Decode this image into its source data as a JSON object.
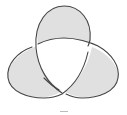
{
  "diagram": {
    "type": "trefoil-knot",
    "colors": {
      "fill": "#e0e0e0",
      "stroke": "#444444",
      "background": "#ffffff",
      "mark": "#bbbbbb"
    }
  }
}
